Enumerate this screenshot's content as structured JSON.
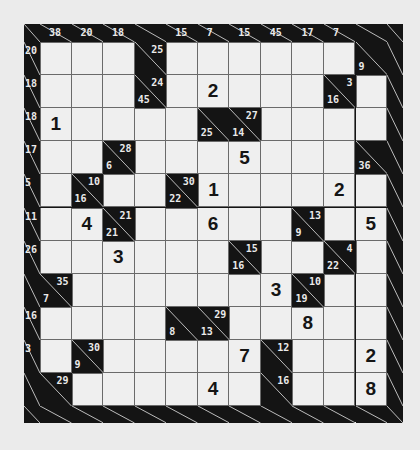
{
  "puzzle": {
    "type": "kakuro",
    "columns": 11,
    "rows": 11,
    "column_down_clues": [
      "38",
      "20",
      "18",
      null,
      "15",
      "7",
      "15",
      "45",
      "17",
      "7",
      null
    ],
    "row_across_clues": [
      "20",
      "18",
      "18",
      "17",
      "5",
      "11",
      "26",
      null,
      "16",
      "3",
      null
    ],
    "cells": [
      [
        "",
        "",
        "",
        {
          "a": "25"
        },
        "",
        "",
        "",
        "",
        "",
        "",
        {
          "d": "9"
        }
      ],
      [
        "",
        "",
        "",
        {
          "a": "24",
          "d": "45"
        },
        "",
        "2",
        "",
        "",
        "",
        {
          "a": "3",
          "d": "16"
        },
        ""
      ],
      [
        "1",
        "",
        "",
        "",
        "",
        {
          "d": "25"
        },
        {
          "a": "27",
          "d": "14"
        },
        "",
        "",
        "",
        ""
      ],
      [
        "",
        "",
        {
          "a": "28",
          "d": "6"
        },
        "",
        "",
        "",
        "5",
        "",
        "",
        "",
        {
          "d": "36"
        }
      ],
      [
        "",
        {
          "a": "10",
          "d": "16"
        },
        "",
        "",
        {
          "a": "30",
          "d": "22"
        },
        "1",
        "",
        "",
        "",
        "2",
        ""
      ],
      [
        "",
        "4",
        {
          "a": "21",
          "d": "21"
        },
        "",
        "",
        "6",
        "",
        "",
        {
          "a": "13",
          "d": "9"
        },
        "",
        "5"
      ],
      [
        "",
        "",
        "3",
        "",
        "",
        "",
        {
          "a": "15",
          "d": "16"
        },
        "",
        "",
        {
          "a": "4",
          "d": "22"
        },
        ""
      ],
      [
        {
          "a": "35",
          "d": "7"
        },
        "",
        "",
        "",
        "",
        "",
        "",
        "3",
        {
          "a": "10",
          "d": "19"
        },
        "",
        ""
      ],
      [
        "",
        "",
        "",
        "",
        {
          "d": "8"
        },
        {
          "a": "29",
          "d": "13"
        },
        "",
        "",
        "8",
        "",
        ""
      ],
      [
        "",
        {
          "a": "30",
          "d": "9"
        },
        "",
        "",
        "",
        "",
        "7",
        {
          "a": "12"
        },
        "",
        "",
        "2"
      ],
      [
        {
          "a": "29"
        },
        "",
        "",
        "",
        "",
        "4",
        "",
        {
          "a": "16"
        },
        "",
        "",
        "8"
      ]
    ]
  },
  "colors": {
    "background": "#ebebeb",
    "block": "#141414",
    "cell": "#efefef",
    "clue_text": "#eaeaea",
    "digit_text": "#151515"
  }
}
